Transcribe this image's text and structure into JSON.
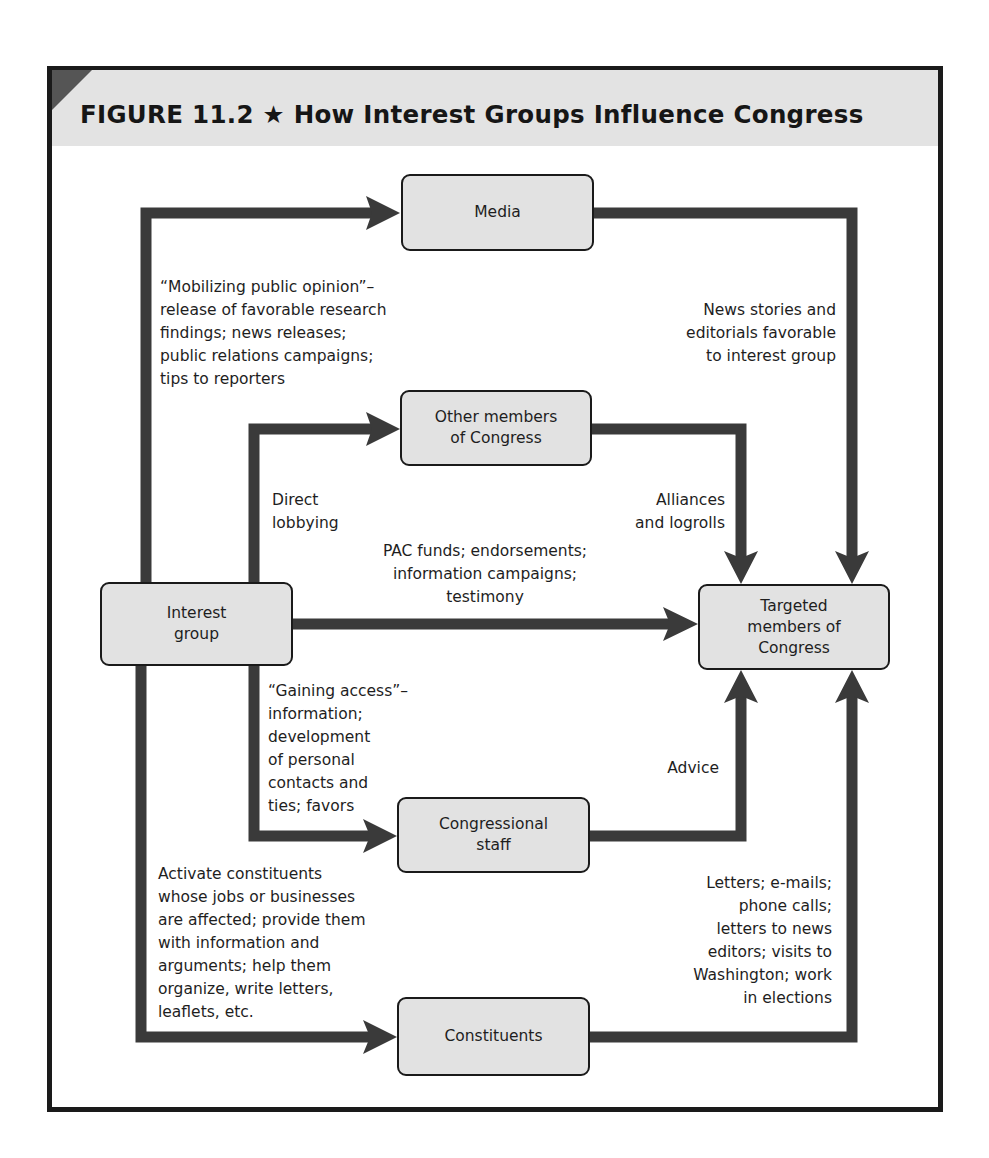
{
  "figure": {
    "title": "FIGURE 11.2 ★  How Interest Groups Influence Congress",
    "colors": {
      "arrow": "#3a3a3a",
      "node_fill": "#e2e2e2",
      "title_band": "#e3e3e3",
      "corner": "#555555"
    }
  },
  "nodes": {
    "interest_group": [
      "Interest",
      "group"
    ],
    "media": [
      "Media"
    ],
    "other_members": [
      "Other members",
      "of Congress"
    ],
    "targeted": [
      "Targeted",
      "members of",
      "Congress"
    ],
    "staff": [
      "Congressional",
      "staff"
    ],
    "constituents": [
      "Constituents"
    ]
  },
  "labels": {
    "mobilizing": [
      "“Mobilizing public opinion”–",
      "release of favorable research",
      "findings; news releases;",
      "public relations campaigns;",
      "tips to reporters"
    ],
    "news": [
      "News stories and",
      "editorials favorable",
      "to interest group"
    ],
    "direct": [
      "Direct",
      "lobbying"
    ],
    "alliances": [
      "Alliances",
      "and logrolls"
    ],
    "pac": [
      "PAC funds; endorsements;",
      "information campaigns;",
      "testimony"
    ],
    "gaining": [
      "“Gaining access”–",
      "information;",
      "development",
      "of personal",
      "contacts and",
      "ties; favors"
    ],
    "advice": [
      "Advice"
    ],
    "activate": [
      "Activate constituents",
      "whose jobs or businesses",
      "are affected; provide them",
      "with information and",
      "arguments; help them",
      "organize, write letters,",
      "leaflets, etc."
    ],
    "letters": [
      "Letters; e-mails;",
      "phone calls;",
      "letters to news",
      "editors; visits to",
      "Washington; work",
      "in elections"
    ]
  }
}
